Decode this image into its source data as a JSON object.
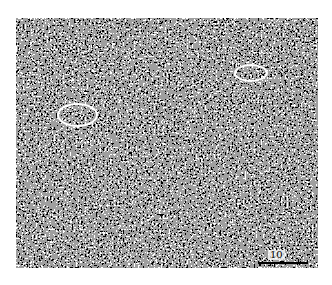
{
  "image": {
    "type": "micrograph",
    "texture": "dense black-and-white granular noise",
    "colors": {
      "background": "#ffffff",
      "annotation": "#ffffff",
      "scale_bar": "#000000"
    }
  },
  "annotations": [
    {
      "shape": "ellipse",
      "cx": 77,
      "cy": 115,
      "rx": 20,
      "ry": 12
    },
    {
      "shape": "ellipse",
      "cx": 251,
      "cy": 73,
      "rx": 17,
      "ry": 9
    }
  ],
  "scale_bar": {
    "label": "10",
    "x1": 258,
    "x2": 308,
    "y": 262
  }
}
